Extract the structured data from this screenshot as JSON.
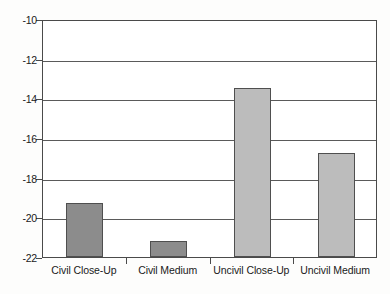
{
  "chart_data": {
    "type": "bar",
    "title": "",
    "xlabel": "",
    "ylabel": "",
    "categories": [
      "Civil Close-Up",
      "Civil Medium",
      "Uncivil Close-Up",
      "Uncivil Medium"
    ],
    "values": [
      -19.3,
      -21.2,
      -13.5,
      -16.75
    ],
    "ylim": [
      -22,
      -10
    ],
    "yticks": [
      -10,
      -12,
      -14,
      -16,
      -18,
      -20,
      -22
    ],
    "ytick_labels": [
      "-10",
      "-12",
      "-14",
      "-16",
      "-18",
      "-20",
      "-22"
    ],
    "grid": true,
    "legend": "none",
    "bar_colors": [
      "#8c8c8c",
      "#8c8c8c",
      "#bcbcbc",
      "#bcbcbc"
    ],
    "bar_border_color": "#4f4f4f",
    "axis_color": "#4a4a4a",
    "plot_background": "#ffffff",
    "figure_background": "#fdfdfc",
    "series": [
      {
        "name": "mean rating",
        "points": [
          {
            "category": "Civil Close-Up",
            "value": -19.3,
            "color": "#8c8c8c"
          },
          {
            "category": "Civil Medium",
            "value": -21.2,
            "color": "#8c8c8c"
          },
          {
            "category": "Uncivil Close-Up",
            "value": -13.5,
            "color": "#bcbcbc"
          },
          {
            "category": "Uncivil Medium",
            "value": -16.75,
            "color": "#bcbcbc"
          }
        ]
      }
    ]
  }
}
